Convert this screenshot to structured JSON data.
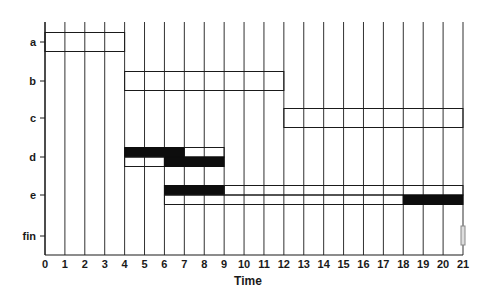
{
  "chart_data": {
    "type": "gantt",
    "title": "",
    "xlabel": "Time",
    "ylabel": "",
    "xlim": [
      0,
      21
    ],
    "x_ticks": [
      0,
      1,
      2,
      3,
      4,
      5,
      6,
      7,
      8,
      9,
      10,
      11,
      12,
      13,
      14,
      15,
      16,
      17,
      18,
      19,
      20,
      21
    ],
    "rows": [
      "a",
      "b",
      "c",
      "d",
      "e",
      "fin"
    ],
    "grid": {
      "vertical": true,
      "horizontal": false
    },
    "tasks": [
      {
        "row": "a",
        "start": 0,
        "end": 4,
        "style": "outline"
      },
      {
        "row": "b",
        "start": 4,
        "end": 12,
        "style": "outline"
      },
      {
        "row": "c",
        "start": 12,
        "end": 21,
        "style": "outline"
      },
      {
        "row": "d",
        "lane": "upper",
        "start": 4,
        "end": 7,
        "style": "filled"
      },
      {
        "row": "d",
        "lane": "upper",
        "start": 7,
        "end": 9,
        "style": "outline"
      },
      {
        "row": "d",
        "lane": "lower",
        "start": 4,
        "end": 6,
        "style": "outline"
      },
      {
        "row": "d",
        "lane": "lower",
        "start": 6,
        "end": 9,
        "style": "filled"
      },
      {
        "row": "e",
        "lane": "upper",
        "start": 6,
        "end": 9,
        "style": "filled"
      },
      {
        "row": "e",
        "lane": "upper",
        "start": 9,
        "end": 21,
        "style": "outline"
      },
      {
        "row": "e",
        "lane": "lower",
        "start": 6,
        "end": 18,
        "style": "outline"
      },
      {
        "row": "e",
        "lane": "lower",
        "start": 18,
        "end": 21,
        "style": "filled"
      },
      {
        "row": "fin",
        "start": 21,
        "end": 21,
        "style": "marker"
      }
    ],
    "colors": {
      "line": "#1a1a1a",
      "fill": "#0d0d0d",
      "marker": "#888888",
      "background": "#ffffff"
    }
  }
}
